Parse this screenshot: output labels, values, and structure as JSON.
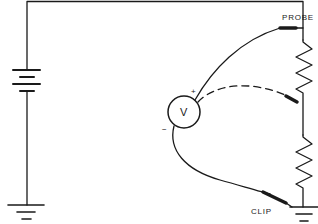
{
  "diagram": {
    "type": "circuit-schematic",
    "labels": {
      "probe": "PROBE",
      "clip": "CLIP",
      "meter": "V",
      "plus": "+",
      "minus": "−"
    },
    "components": [
      {
        "id": "battery",
        "kind": "battery",
        "cells": 2
      },
      {
        "id": "resistor-top",
        "kind": "resistor"
      },
      {
        "id": "resistor-bottom",
        "kind": "resistor"
      },
      {
        "id": "voltmeter",
        "kind": "voltmeter",
        "symbol": "V"
      },
      {
        "id": "ground-left",
        "kind": "ground"
      },
      {
        "id": "ground-right",
        "kind": "ground"
      },
      {
        "id": "probe-lead",
        "kind": "test-lead",
        "style": "solid",
        "connects": [
          "voltmeter+",
          "top of resistor-top"
        ]
      },
      {
        "id": "probe-lead-alt",
        "kind": "test-lead",
        "style": "dashed",
        "connects": [
          "voltmeter+",
          "between resistors"
        ]
      },
      {
        "id": "clip-lead",
        "kind": "test-lead",
        "style": "solid",
        "connects": [
          "voltmeter-",
          "ground"
        ]
      }
    ],
    "colors": {
      "stroke": "#1a1a1a",
      "background": "#ffffff"
    }
  }
}
